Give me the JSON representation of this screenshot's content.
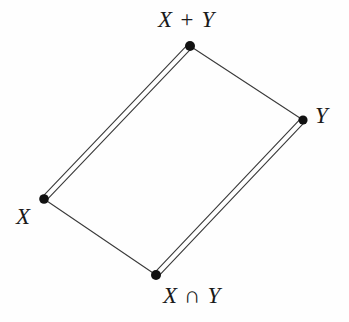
{
  "figure": {
    "kind": "hasse-lattice-diagram",
    "background_color": "#fefefe",
    "line_color": "#3a3a3a",
    "node_color": "#111111",
    "width": 349,
    "height": 322
  },
  "nodes": [
    {
      "id": "top",
      "label": "X + Y",
      "x": 190,
      "y": 46,
      "radius": 5.0
    },
    {
      "id": "right",
      "label": "Y",
      "x": 303,
      "y": 120,
      "radius": 4.6
    },
    {
      "id": "left",
      "label": "X",
      "x": 44,
      "y": 199,
      "radius": 4.8
    },
    {
      "id": "bottom",
      "label": "X ∩ Y",
      "x": 156,
      "y": 275,
      "radius": 5.0
    }
  ],
  "edges": [
    {
      "id": "left-to-top",
      "from": "left",
      "to": "top",
      "style": "double",
      "stroke_width": 1.1,
      "offset": 2.6
    },
    {
      "id": "bottom-to-right",
      "from": "bottom",
      "to": "right",
      "style": "double",
      "stroke_width": 1.1,
      "offset": 2.6
    },
    {
      "id": "top-to-right",
      "from": "top",
      "to": "right",
      "style": "single",
      "stroke_width": 1.1,
      "offset": 0
    },
    {
      "id": "left-to-bottom",
      "from": "left",
      "to": "bottom",
      "style": "single",
      "stroke_width": 1.1,
      "offset": 0
    }
  ],
  "labels": {
    "top": "X + Y",
    "right": "Y",
    "left": "X",
    "bottom": "X ∩ Y"
  }
}
